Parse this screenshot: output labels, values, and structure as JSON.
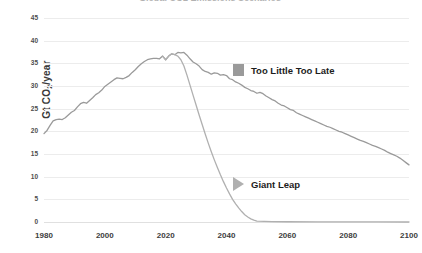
{
  "chart_data": {
    "type": "line",
    "title": "Global CO2 Emissions Scenarios",
    "xlabel": "",
    "ylabel": "Gt CO2/year",
    "ylabel_prefix": "Gt CO",
    "ylabel_sub": "2",
    "ylabel_suffix": "/year",
    "xlim": [
      1980,
      2100
    ],
    "ylim": [
      0,
      45
    ],
    "xticks": [
      1980,
      2000,
      2020,
      2040,
      2060,
      2080,
      2100
    ],
    "yticks": [
      0,
      5,
      10,
      15,
      20,
      25,
      30,
      35,
      40,
      45
    ],
    "grid": true,
    "legend_position": "inside-right",
    "series": [
      {
        "name": "Too Little Too Late",
        "marker": "square",
        "color": "#9a9a9a",
        "x": [
          1980,
          1981,
          1982,
          1983,
          1984,
          1985,
          1986,
          1987,
          1988,
          1989,
          1990,
          1991,
          1992,
          1993,
          1994,
          1995,
          1996,
          1997,
          1998,
          1999,
          2000,
          2001,
          2002,
          2003,
          2004,
          2005,
          2006,
          2007,
          2008,
          2009,
          2010,
          2011,
          2012,
          2013,
          2014,
          2015,
          2016,
          2017,
          2018,
          2019,
          2020,
          2021,
          2022,
          2023,
          2024,
          2025,
          2026,
          2027,
          2028,
          2029,
          2030,
          2031,
          2032,
          2033,
          2034,
          2035,
          2036,
          2037,
          2038,
          2039,
          2040,
          2041,
          2042,
          2043,
          2044,
          2045,
          2046,
          2047,
          2048,
          2049,
          2050,
          2051,
          2052,
          2053,
          2054,
          2055,
          2056,
          2057,
          2058,
          2059,
          2060,
          2061,
          2062,
          2063,
          2064,
          2065,
          2066,
          2067,
          2068,
          2069,
          2070,
          2071,
          2072,
          2073,
          2074,
          2075,
          2076,
          2077,
          2078,
          2079,
          2080,
          2081,
          2082,
          2083,
          2084,
          2085,
          2086,
          2087,
          2088,
          2089,
          2090,
          2091,
          2092,
          2093,
          2094,
          2095,
          2096,
          2097,
          2098,
          2099,
          2100
        ],
        "values": [
          19.5,
          20.2,
          21.3,
          22.3,
          22.6,
          22.7,
          22.6,
          23.0,
          23.6,
          24.2,
          24.6,
          25.4,
          26.1,
          26.4,
          26.2,
          26.8,
          27.4,
          28.1,
          28.5,
          29.1,
          29.9,
          30.4,
          30.9,
          31.4,
          31.8,
          31.7,
          31.6,
          31.9,
          32.3,
          33.0,
          33.6,
          34.3,
          34.9,
          35.4,
          35.8,
          36.0,
          36.1,
          36.1,
          36.0,
          36.6,
          35.8,
          36.6,
          37.1,
          36.9,
          37.4,
          37.3,
          37.4,
          36.8,
          36.0,
          35.3,
          34.9,
          34.4,
          33.6,
          33.2,
          33.0,
          32.6,
          32.9,
          32.8,
          32.4,
          32.5,
          32.3,
          31.6,
          31.4,
          30.9,
          30.6,
          30.2,
          29.7,
          29.4,
          29.0,
          28.8,
          28.4,
          28.6,
          28.3,
          27.8,
          27.4,
          27.0,
          26.7,
          26.2,
          25.8,
          25.6,
          25.2,
          24.8,
          24.6,
          24.1,
          23.8,
          23.5,
          23.2,
          22.9,
          22.6,
          22.3,
          22.0,
          21.7,
          21.4,
          21.1,
          20.9,
          20.6,
          20.3,
          20.0,
          19.8,
          19.5,
          19.2,
          18.9,
          18.6,
          18.3,
          18.0,
          17.8,
          17.5,
          17.2,
          16.9,
          16.7,
          16.4,
          16.1,
          15.8,
          15.4,
          15.1,
          14.8,
          14.5,
          14.1,
          13.6,
          13.1,
          12.6
        ]
      },
      {
        "name": "Giant Leap",
        "marker": "triangle",
        "color": "#b0b0b0",
        "x": [
          2019,
          2020,
          2021,
          2022,
          2023,
          2024,
          2025,
          2026,
          2027,
          2028,
          2029,
          2030,
          2031,
          2032,
          2033,
          2034,
          2035,
          2036,
          2037,
          2038,
          2039,
          2040,
          2041,
          2042,
          2043,
          2044,
          2045,
          2046,
          2047,
          2048,
          2049,
          2050,
          2055,
          2060,
          2070,
          2080,
          2090,
          2100
        ],
        "values": [
          36.6,
          35.8,
          36.6,
          37.1,
          36.9,
          36.6,
          35.8,
          34.4,
          32.4,
          30.2,
          28.0,
          25.8,
          23.6,
          21.5,
          19.4,
          17.4,
          15.5,
          13.7,
          12.0,
          10.4,
          8.9,
          7.5,
          6.2,
          5.0,
          4.0,
          3.1,
          2.3,
          1.6,
          1.1,
          0.7,
          0.4,
          0.2,
          0.1,
          0.05,
          0.03,
          0.02,
          0.01,
          0.0
        ]
      }
    ]
  },
  "legend": {
    "items": [
      {
        "label": "Too Little Too Late",
        "marker": "square"
      },
      {
        "label": "Giant Leap",
        "marker": "triangle"
      }
    ]
  }
}
